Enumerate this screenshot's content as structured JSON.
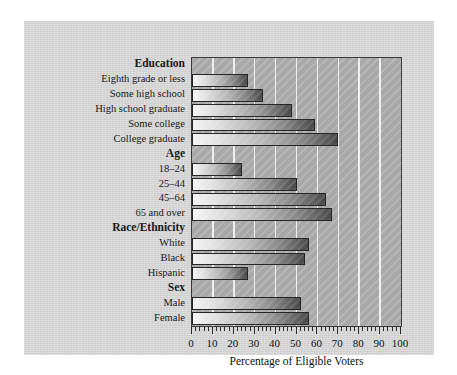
{
  "chart_data": {
    "type": "bar",
    "orientation": "horizontal",
    "title": "",
    "xlabel": "Percentage of Eligible Voters",
    "ylabel": "",
    "xlim": [
      0,
      100
    ],
    "xticks": [
      0,
      10,
      20,
      30,
      40,
      50,
      60,
      70,
      80,
      90,
      100
    ],
    "xtick_labels": [
      "0",
      "10",
      "20",
      "30",
      "40",
      "50",
      "60",
      "70",
      "80",
      "90",
      "100"
    ],
    "minor_tick_step": 2,
    "grid": true,
    "grid_axis": "x",
    "grid_color": "#efefef",
    "legend": null,
    "groups": [
      {
        "name": "Education",
        "categories": [
          "Eighth grade or less",
          "Some high school",
          "High school graduate",
          "Some college",
          "College graduate"
        ],
        "values": [
          27,
          34,
          48,
          59,
          70
        ]
      },
      {
        "name": "Age",
        "categories": [
          "18–24",
          "25–44",
          "45–64",
          "65 and over"
        ],
        "values": [
          24,
          50,
          64,
          67
        ]
      },
      {
        "name": "Race/Ethnicity",
        "categories": [
          "White",
          "Black",
          "Hispanic"
        ],
        "values": [
          56,
          54,
          27
        ]
      },
      {
        "name": "Sex",
        "categories": [
          "Male",
          "Female"
        ],
        "values": [
          52,
          56
        ]
      }
    ],
    "categories": [
      "Eighth grade or less",
      "Some high school",
      "High school graduate",
      "Some college",
      "College graduate",
      "18–24",
      "25–44",
      "45–64",
      "65 and over",
      "White",
      "Black",
      "Hispanic",
      "Male",
      "Female"
    ],
    "values": [
      27,
      34,
      48,
      59,
      70,
      24,
      50,
      64,
      67,
      56,
      54,
      27,
      52,
      56
    ],
    "colors": {
      "panel_background": "#d6d6d6",
      "plot_background": "#a8a8a8",
      "gridline": "#efefef",
      "bar_light": "#f4f4f4",
      "bar_dark": "#4a4a4a",
      "axis_line": "#2b2b2b",
      "text": "#1a1a1a"
    }
  },
  "rows": [
    {
      "kind": "group",
      "label": "Education"
    },
    {
      "kind": "category",
      "label": "Eighth grade or less",
      "value": 27
    },
    {
      "kind": "category",
      "label": "Some high school",
      "value": 34
    },
    {
      "kind": "category",
      "label": "High school graduate",
      "value": 48
    },
    {
      "kind": "category",
      "label": "Some college",
      "value": 59
    },
    {
      "kind": "category",
      "label": "College graduate",
      "value": 70
    },
    {
      "kind": "group",
      "label": "Age"
    },
    {
      "kind": "category",
      "label": "18–24",
      "value": 24
    },
    {
      "kind": "category",
      "label": "25–44",
      "value": 50
    },
    {
      "kind": "category",
      "label": "45–64",
      "value": 64
    },
    {
      "kind": "category",
      "label": "65 and over",
      "value": 67
    },
    {
      "kind": "group",
      "label": "Race/Ethnicity"
    },
    {
      "kind": "category",
      "label": "White",
      "value": 56
    },
    {
      "kind": "category",
      "label": "Black",
      "value": 54
    },
    {
      "kind": "category",
      "label": "Hispanic",
      "value": 27
    },
    {
      "kind": "group",
      "label": "Sex"
    },
    {
      "kind": "category",
      "label": "Male",
      "value": 52
    },
    {
      "kind": "category",
      "label": "Female",
      "value": 56
    }
  ],
  "axis": {
    "xlabel": "Percentage of Eligible Voters",
    "tick_labels": [
      "0",
      "10",
      "20",
      "30",
      "40",
      "50",
      "60",
      "70",
      "80",
      "90",
      "100"
    ]
  }
}
